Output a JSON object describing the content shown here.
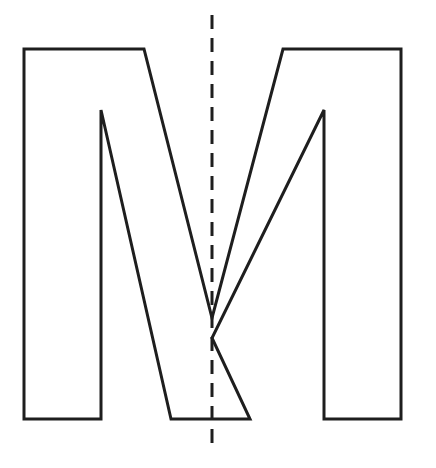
{
  "figure": {
    "description": "Outline of capital letter M with vertical dashed line of symmetry",
    "letter": "M",
    "stroke_color": "#1e1e1e",
    "background": "#ffffff",
    "outline_points": [
      [
        24,
        49
      ],
      [
        144,
        49
      ],
      [
        212,
        318
      ],
      [
        283,
        49
      ],
      [
        401,
        49
      ],
      [
        401,
        419
      ],
      [
        324,
        419
      ],
      [
        324,
        110
      ],
      [
        212,
        338
      ],
      [
        250,
        419
      ],
      [
        171,
        419
      ],
      [
        101,
        110
      ],
      [
        101,
        419
      ],
      [
        24,
        419
      ]
    ],
    "symmetry_line": {
      "x": 212,
      "y1": 15,
      "y2": 452,
      "dash": "14 9"
    }
  }
}
